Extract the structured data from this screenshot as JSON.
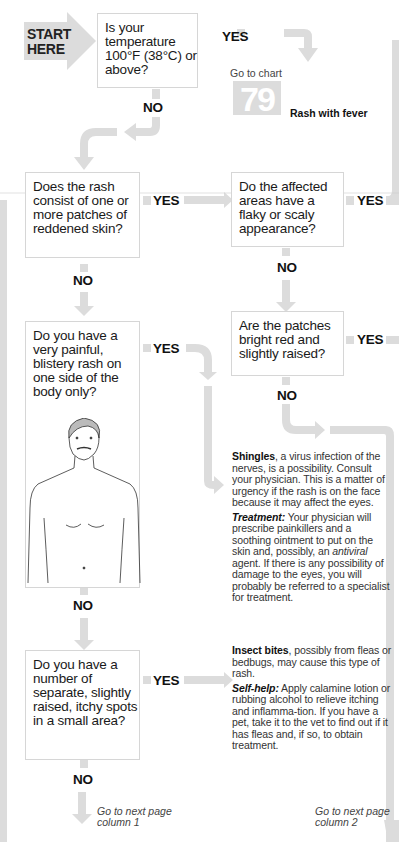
{
  "start": {
    "line1": "START",
    "line2": "HERE"
  },
  "questions": [
    {
      "id": "q1",
      "text": "Is your temperature 100°F (38°C) or above?"
    },
    {
      "id": "q2",
      "text": "Does the rash consist of one or more patches of reddened skin?"
    },
    {
      "id": "q3",
      "text": "Do the affected areas have a flaky or scaly appearance?"
    },
    {
      "id": "q4",
      "text": "Are the patches bright red and slightly raised?"
    },
    {
      "id": "q5",
      "text": "Do you have a very painful, blistery rash on one side of the body only?"
    },
    {
      "id": "q6",
      "text": "Do you have a number of separate, slightly raised, itchy spots in a small area?"
    }
  ],
  "labels": {
    "yes": "YES",
    "no": "NO"
  },
  "goto_chart": {
    "prefix": "Go to chart",
    "number": "79",
    "title": "Rash with fever"
  },
  "diagnoses": {
    "shingles": {
      "title": "Shingles",
      "body": ", a virus infection of the nerves, is a possibility. Consult your physician. This is a matter of urgency if the rash is on the face because it may affect the eyes.",
      "advice_label": "Treatment:",
      "advice_body_1": " Your physician will prescribe painkillers and a soothing ointment to put on the skin and, possibly, an ",
      "advice_emph": "antiviral",
      "advice_body_2": " agent. If there is any possibility of damage to the eyes, you will probably be referred to a specialist for treatment."
    },
    "insect_bites": {
      "title": "Insect bites",
      "body": ", possibly from fleas or bedbugs, may cause this type of rash.",
      "advice_label": "Self-help:",
      "advice_body": " Apply calamine lotion or rubbing alcohol to relieve itching and inflamma-tion. If you have a pet, take it to the vet to find out if it has fleas and, if so, to obtain treatment."
    }
  },
  "next_page": [
    {
      "line1": "Go to next page",
      "line2": "column 1"
    },
    {
      "line1": "Go to next page",
      "line2": "column 2"
    }
  ],
  "colors": {
    "arrow": "#dcdcdc",
    "box_border": "#d6d6d6",
    "text": "#1a1a1a"
  }
}
